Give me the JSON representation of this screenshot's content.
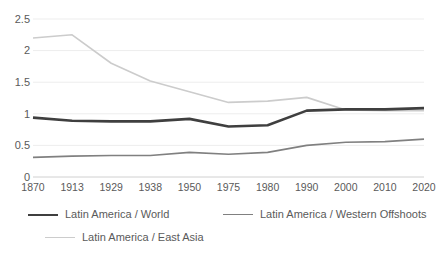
{
  "chart_data": {
    "type": "line",
    "title": "",
    "subtitle": "",
    "xlabel": "",
    "ylabel": "",
    "categories": [
      "1870",
      "1913",
      "1929",
      "1938",
      "1950",
      "1975",
      "1980",
      "1990",
      "2000",
      "2010",
      "2020"
    ],
    "ylim": [
      0,
      2.5
    ],
    "yticks": [
      "0",
      "0.5",
      "1",
      "1.5",
      "2",
      "2.5"
    ],
    "ytick_values": [
      0,
      0.5,
      1,
      1.5,
      2,
      2.5
    ],
    "grid": true,
    "grid_axis": "y",
    "legend_position": "bottom",
    "series": [
      {
        "name": "Latin America / World",
        "color": "#3f3f3f",
        "width": 2.6,
        "values": [
          0.94,
          0.89,
          0.88,
          0.88,
          0.92,
          0.8,
          0.82,
          1.05,
          1.07,
          1.07,
          1.09
        ]
      },
      {
        "name": "Latin America / Western Offshoots",
        "color": "#808080",
        "width": 1.6,
        "values": [
          0.31,
          0.33,
          0.34,
          0.34,
          0.39,
          0.36,
          0.39,
          0.5,
          0.55,
          0.56,
          0.6
        ]
      },
      {
        "name": "Latin America / East Asia",
        "color": "#cccccc",
        "width": 1.6,
        "values": [
          2.2,
          2.25,
          1.8,
          1.52,
          1.35,
          1.18,
          1.2,
          1.26,
          1.06,
          1.05,
          1.05
        ]
      }
    ]
  },
  "axes": {
    "y_axis_labels": [
      "2.5",
      "2",
      "1.5",
      "1",
      "0.5",
      "0"
    ],
    "x_axis_labels": [
      "1870",
      "1913",
      "1929",
      "1938",
      "1950",
      "1975",
      "1980",
      "1990",
      "2000",
      "2010",
      "2020"
    ]
  },
  "legend": {
    "items": [
      {
        "label": "Latin America / World",
        "color": "#3f3f3f",
        "thickness": "2.6px"
      },
      {
        "label": "Latin America / Western Offshoots",
        "color": "#808080",
        "thickness": "1.6px"
      },
      {
        "label": "Latin America / East Asia",
        "color": "#cccccc",
        "thickness": "1.6px"
      }
    ]
  },
  "style": {
    "background": "#ffffff",
    "gridline_color": "#ededed",
    "axis_color": "#d0d0d0",
    "text_color": "#5a5a5a"
  }
}
